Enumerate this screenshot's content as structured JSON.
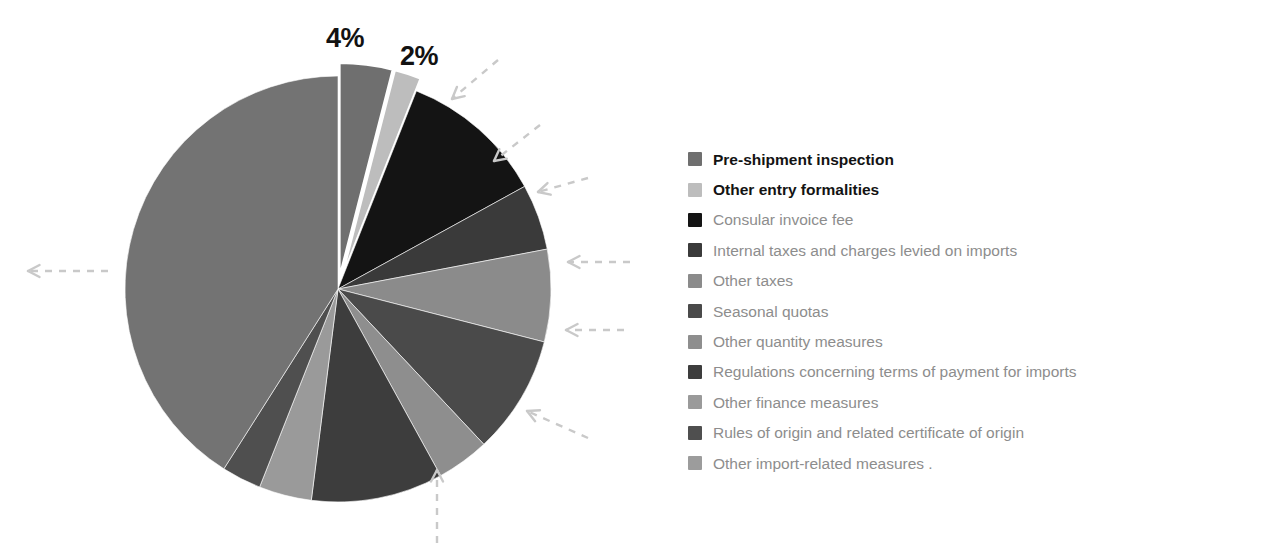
{
  "chart_data": {
    "type": "pie",
    "title": "",
    "legend_position": "right",
    "grid": false,
    "categories": [
      "Pre-shipment inspection",
      "Other entry formalities",
      "Consular invoice fee",
      "Internal taxes and charges levied on imports",
      "Other taxes",
      "Seasonal quotas",
      "Other quantity measures",
      "Regulations concerning terms of payment for imports",
      "Other finance measures",
      "Rules of origin and related certificate of origin",
      "Other import-related measures"
    ],
    "values": [
      4,
      2,
      11,
      5,
      7,
      9,
      4,
      10,
      4,
      3,
      41
    ],
    "colors": [
      "#6f6f6f",
      "#bdbdbd",
      "#141414",
      "#3a3a3a",
      "#8b8b8b",
      "#4a4a4a",
      "#8e8e8e",
      "#3d3d3d",
      "#9a9a9a",
      "#4f4f4f",
      "#737373"
    ],
    "data_labels": [
      {
        "id": "pct-label-0",
        "text": "4%",
        "slice": "Pre-shipment inspection"
      },
      {
        "id": "pct-label-1",
        "text": "2%",
        "slice": "Other entry formalities"
      }
    ],
    "exploded_slices": [
      "Pre-shipment inspection",
      "Other entry formalities"
    ]
  },
  "legend": {
    "items": [
      {
        "label": "Pre-shipment inspection",
        "color": "#6f6f6f",
        "emphasis": "bold"
      },
      {
        "label": "Other entry formalities",
        "color": "#bdbdbd",
        "emphasis": "bold"
      },
      {
        "label": "Consular invoice fee",
        "color": "#141414",
        "emphasis": "faded"
      },
      {
        "label": "Internal taxes and charges levied on imports",
        "color": "#3a3a3a",
        "emphasis": "faded"
      },
      {
        "label": "Other taxes",
        "color": "#8b8b8b",
        "emphasis": "faded"
      },
      {
        "label": "Seasonal quotas",
        "color": "#4a4a4a",
        "emphasis": "faded"
      },
      {
        "label": "Other quantity measures",
        "color": "#8e8e8e",
        "emphasis": "faded"
      },
      {
        "label": "Regulations concerning terms of payment for imports",
        "color": "#3d3d3d",
        "emphasis": "faded"
      },
      {
        "label": "Other finance measures",
        "color": "#9a9a9a",
        "emphasis": "faded"
      },
      {
        "label": "Rules of origin and related certificate of origin",
        "color": "#4f4f4f",
        "emphasis": "faded"
      },
      {
        "label": "Other import-related measures .",
        "color": "#9c9c9c",
        "emphasis": "faded"
      }
    ]
  },
  "annotations": {
    "arrow_color": "#c9c9c9",
    "arrows": [
      {
        "name": "arrow-left",
        "direction": "right"
      },
      {
        "name": "arrow-upper-right-1",
        "direction": "left-down"
      },
      {
        "name": "arrow-upper-right-2",
        "direction": "left-down"
      },
      {
        "name": "arrow-right-1",
        "direction": "left-down"
      },
      {
        "name": "arrow-right-2",
        "direction": "left"
      },
      {
        "name": "arrow-right-3",
        "direction": "left"
      },
      {
        "name": "arrow-lower-right",
        "direction": "left-up"
      },
      {
        "name": "arrow-bottom",
        "direction": "up"
      }
    ]
  }
}
